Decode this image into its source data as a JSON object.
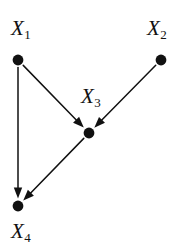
{
  "figure": {
    "type": "directed-acyclic-graph",
    "title": "",
    "background_color": "#ffffff",
    "ink_color": "#111111",
    "width": 186,
    "height": 250
  },
  "nodes": [
    {
      "id": "X1",
      "label_base": "X",
      "label_sub": "1",
      "x": 18,
      "y": 60,
      "radius": 5.4,
      "label_x": 11,
      "label_y": 18
    },
    {
      "id": "X2",
      "label_base": "X",
      "label_sub": "2",
      "x": 161,
      "y": 60,
      "radius": 5.4,
      "label_x": 147,
      "label_y": 18
    },
    {
      "id": "X3",
      "label_base": "X",
      "label_sub": "3",
      "x": 89,
      "y": 133,
      "radius": 5.4,
      "label_x": 81,
      "label_y": 86
    },
    {
      "id": "X4",
      "label_base": "X",
      "label_sub": "4",
      "x": 18,
      "y": 206,
      "radius": 5.4,
      "label_x": 11,
      "label_y": 221
    }
  ],
  "edges": [
    {
      "id": "e-x1-x3",
      "from": "X1",
      "to": "X3",
      "arrow": true
    },
    {
      "id": "e-x1-x4",
      "from": "X1",
      "to": "X4",
      "arrow": true
    },
    {
      "id": "e-x2-x3",
      "from": "X2",
      "to": "X3",
      "arrow": true
    },
    {
      "id": "e-x3-x4",
      "from": "X3",
      "to": "X4",
      "arrow": true
    }
  ],
  "style": {
    "edge_width": 1.5,
    "arrow_length": 11,
    "arrow_half_width": 4.2,
    "node_gap": 7.5
  }
}
